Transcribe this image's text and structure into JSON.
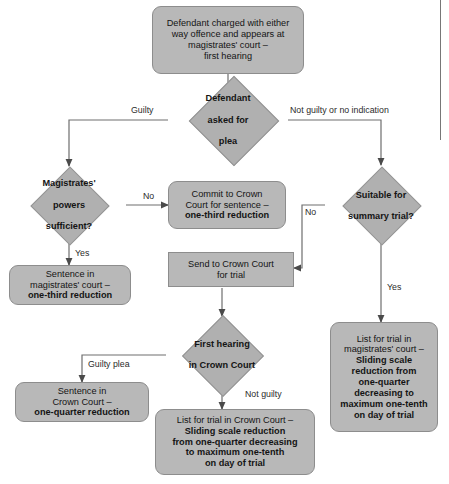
{
  "diagram": {
    "colors": {
      "node_fill": "#b8b8b8",
      "diamond_fill": "#b0b0b0",
      "node_border": "#8d8d8d",
      "connector": "#6e6e6e",
      "text": "#141414",
      "page_background": "#ffffff"
    },
    "nodes": [
      {
        "id": "start",
        "shape": "rounded-rect",
        "lines": [
          {
            "text": "Defendant charged with either",
            "bold": false
          },
          {
            "text": "way offence and appears at",
            "bold": false
          },
          {
            "text": "magistrates' court –",
            "bold": false
          },
          {
            "text": "first hearing",
            "bold": false
          }
        ]
      },
      {
        "id": "plea-decision",
        "shape": "diamond",
        "lines": [
          {
            "text": "Defendant",
            "bold": true
          },
          {
            "text": "asked for",
            "bold": true
          },
          {
            "text": "plea",
            "bold": true
          }
        ]
      },
      {
        "id": "powers-decision",
        "shape": "diamond",
        "lines": [
          {
            "text": "Magistrates'",
            "bold": true
          },
          {
            "text": "powers",
            "bold": true
          },
          {
            "text": "sufficient?",
            "bold": true
          }
        ]
      },
      {
        "id": "commit-crown",
        "shape": "rounded-rect",
        "lines": [
          {
            "text": "Commit to Crown",
            "bold": false
          },
          {
            "text": "Court for sentence –",
            "bold": false
          },
          {
            "text": "one-third reduction",
            "bold": true
          }
        ]
      },
      {
        "id": "summary-decision",
        "shape": "diamond",
        "lines": [
          {
            "text": "Suitable for",
            "bold": true
          },
          {
            "text": "summary trial?",
            "bold": true
          }
        ]
      },
      {
        "id": "sentence-magistrates",
        "shape": "rounded-rect",
        "lines": [
          {
            "text": "Sentence in",
            "bold": false
          },
          {
            "text": "magistrates' court –",
            "bold": false
          },
          {
            "text": "one-third reduction",
            "bold": true
          }
        ]
      },
      {
        "id": "send-crown",
        "shape": "rect",
        "lines": [
          {
            "text": "Send to Crown Court",
            "bold": false
          },
          {
            "text": "for trial",
            "bold": false
          }
        ]
      },
      {
        "id": "list-magistrates",
        "shape": "rounded-rect",
        "lines": [
          {
            "text": "List for trial in",
            "bold": false
          },
          {
            "text": "magistrates' court –",
            "bold": false
          },
          {
            "text": "Sliding scale",
            "bold": true
          },
          {
            "text": "reduction from",
            "bold": true
          },
          {
            "text": "one-quarter",
            "bold": true
          },
          {
            "text": "decreasing to",
            "bold": true
          },
          {
            "text": "maximum one-tenth",
            "bold": true
          },
          {
            "text": "on day of trial",
            "bold": true
          }
        ]
      },
      {
        "id": "first-hearing-crown",
        "shape": "diamond",
        "lines": [
          {
            "text": "First hearing",
            "bold": true
          },
          {
            "text": "in Crown Court",
            "bold": true
          }
        ]
      },
      {
        "id": "sentence-crown",
        "shape": "rounded-rect",
        "lines": [
          {
            "text": "Sentence in",
            "bold": false
          },
          {
            "text": "Crown Court –",
            "bold": false
          },
          {
            "text": "one-quarter reduction",
            "bold": true
          }
        ]
      },
      {
        "id": "list-crown",
        "shape": "rounded-rect",
        "lines": [
          {
            "text": "List for trial in Crown Court –",
            "bold": false
          },
          {
            "text": "Sliding scale reduction",
            "bold": true
          },
          {
            "text": "from one-quarter decreasing",
            "bold": true
          },
          {
            "text": "to maximum one-tenth",
            "bold": true
          },
          {
            "text": "on day of trial",
            "bold": true
          }
        ]
      }
    ],
    "edge_labels": [
      {
        "id": "guilty",
        "text": "Guilty"
      },
      {
        "id": "not-guilty-or-no-indication",
        "text": "Not guilty or no indication"
      },
      {
        "id": "powers-no",
        "text": "No"
      },
      {
        "id": "powers-yes",
        "text": "Yes"
      },
      {
        "id": "summary-no",
        "text": "No"
      },
      {
        "id": "summary-yes",
        "text": "Yes"
      },
      {
        "id": "guilty-plea",
        "text": "Guilty plea"
      },
      {
        "id": "not-guilty",
        "text": "Not guilty"
      }
    ]
  }
}
